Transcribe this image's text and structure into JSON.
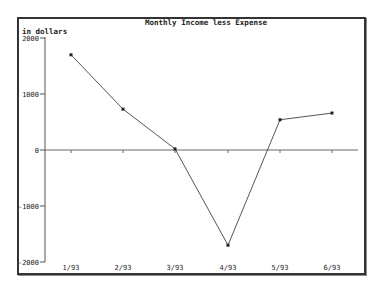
{
  "chart_data": {
    "type": "line",
    "title": "Monthly Income less Expense",
    "xlabel": "",
    "ylabel": "in dollars",
    "categories": [
      "1/93",
      "2/93",
      "3/93",
      "4/93",
      "5/93",
      "6/93"
    ],
    "series": [
      {
        "name": "Income less Expense",
        "values": [
          1700,
          730,
          20,
          -1700,
          540,
          660
        ]
      }
    ],
    "yticks": [
      2000,
      1000,
      0,
      -1000,
      -2000
    ],
    "ytick_labels": [
      "2000",
      "1000",
      "0",
      "-1000",
      "-2000"
    ],
    "ylim": [
      -2000,
      2000
    ],
    "grid": false,
    "zero_line": true,
    "legend": "none",
    "line_color": "#555555",
    "marker_color": "#222222"
  }
}
